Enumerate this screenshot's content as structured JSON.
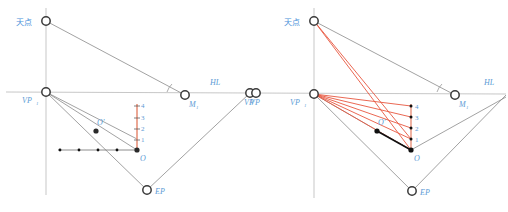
{
  "figure": {
    "panels": [
      {
        "id": "left",
        "name": "left-panel",
        "nodes": [
          {
            "key": "zenith",
            "label": "天点",
            "x": 46,
            "y": 21,
            "type": "open-circle",
            "label_dx": -30,
            "label_dy": 4
          },
          {
            "key": "vp1",
            "label": "VP",
            "sub": "1",
            "x": 46,
            "y": 92,
            "type": "open-circle",
            "label_dx": -24,
            "label_dy": 11
          },
          {
            "key": "m1",
            "label": "M",
            "sub": "1",
            "x": 185,
            "y": 95,
            "type": "open-circle",
            "label_dx": 4,
            "label_dy": 12
          },
          {
            "key": "vp2",
            "label": "VP",
            "sub": "2",
            "x": 250,
            "y": 93,
            "type": "open-circle",
            "label_dx": -4,
            "label_dy": 12
          },
          {
            "key": "ep",
            "label": "EP",
            "x": 147,
            "y": 190,
            "type": "open-circle",
            "label_dx": 8,
            "label_dy": 4
          },
          {
            "key": "o",
            "label": "O",
            "x": 137,
            "y": 150,
            "type": "filled-dot",
            "label_dx": 3,
            "label_dy": 11
          },
          {
            "key": "oprime",
            "label": "O'",
            "x": 96,
            "y": 131,
            "type": "filled-dot",
            "label_dx": 1,
            "label_dy": -6
          }
        ],
        "hl_label": "HL",
        "hl_label_x": 210,
        "hl_label_y": 85,
        "scale_numbers": [
          "4",
          "3",
          "2",
          "1"
        ],
        "scale_x": 137,
        "scale_top_y": 104,
        "scale_bottom_y": 150,
        "ground_dots": [
          60,
          79,
          98,
          117,
          137
        ],
        "ground_y": 150,
        "red_rays": []
      },
      {
        "id": "right",
        "name": "right-panel",
        "nodes": [
          {
            "key": "zenith",
            "label": "天点",
            "x": 314,
            "y": 21,
            "type": "open-circle",
            "label_dx": -30,
            "label_dy": 4
          },
          {
            "key": "vp1",
            "label": "VP",
            "sub": "1",
            "x": 314,
            "y": 94,
            "type": "open-circle",
            "label_dx": -26,
            "label_dy": 12
          },
          {
            "key": "m1",
            "label": "M",
            "sub": "1",
            "x": 455,
            "y": 95,
            "type": "open-circle",
            "label_dx": 4,
            "label_dy": 12
          },
          {
            "key": "vp2",
            "label": "VP",
            "sub": "2",
            "x": 256,
            "y": 93,
            "type": "open-circle",
            "label_dx": -6,
            "label_dy": 12
          },
          {
            "key": "ep",
            "label": "EP",
            "x": 412,
            "y": 191,
            "type": "open-circle",
            "label_dx": 8,
            "label_dy": 4
          },
          {
            "key": "o",
            "label": "O",
            "x": 411,
            "y": 150,
            "type": "filled-dot",
            "label_dx": 3,
            "label_dy": 11
          },
          {
            "key": "oprime",
            "label": "O'",
            "x": 377,
            "y": 131,
            "type": "filled-dot",
            "label_dx": 1,
            "label_dy": -6
          }
        ],
        "hl_label": "HL",
        "hl_label_x": 484,
        "hl_label_y": 85,
        "scale_numbers": [
          "4",
          "3",
          "2",
          "1"
        ],
        "scale_x": 411,
        "scale_top_y": 104,
        "scale_bottom_y": 150,
        "ground_dots": [],
        "ground_y": 150
      }
    ],
    "colors": {
      "construction_line": "#8a8a8a",
      "red_ray": "#e8573f",
      "scale_line": "#e8917a",
      "label_blue": "#5b9bd5",
      "node_stroke": "#3a3a3a",
      "node_fill": "#ffffff",
      "dot_fill": "#111111",
      "background": "#ffffff"
    }
  }
}
